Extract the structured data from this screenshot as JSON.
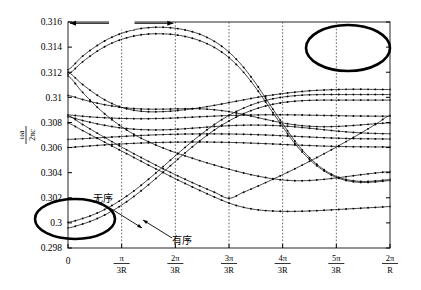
{
  "figure": {
    "bz_label": "1 BZ",
    "annotations": [
      {
        "name": "disordered",
        "text": "无序"
      },
      {
        "name": "ordered",
        "text": "有序"
      }
    ],
    "highlight_ellipses": [
      {
        "name": "top-right-ellipse",
        "cx": 348,
        "cy": 48,
        "rx": 42,
        "ry": 23
      },
      {
        "name": "bottom-left-ellipse",
        "cx": 75,
        "cy": 219,
        "rx": 40,
        "ry": 20
      }
    ]
  },
  "chart_data": {
    "type": "line",
    "title": "",
    "xlabel": "",
    "ylabel": "ωa/2πc",
    "ylabel_parts": {
      "num": "ωa",
      "den": "2πc"
    },
    "xlim": [
      0,
      6
    ],
    "ylim": [
      0.298,
      0.316
    ],
    "grid": "vertical-dotted",
    "legend": "none",
    "marker": "dot",
    "ytick_values": [
      0.298,
      0.3,
      0.302,
      0.304,
      0.306,
      0.308,
      0.31,
      0.312,
      0.314,
      0.316
    ],
    "ytick_labels": [
      "0.298",
      "0.3",
      "0.302",
      "0.304",
      "0.306",
      "0.308",
      "0.31",
      "0.312",
      "0.314",
      "0.316"
    ],
    "xtick_values": [
      0,
      1,
      2,
      3,
      4,
      5,
      6
    ],
    "xtick_labels": [
      "0",
      "π/3R",
      "2π/3R",
      "3π/3R",
      "4π/3R",
      "5π/3R",
      "2π/R"
    ],
    "xtick_parts": [
      {
        "whole": "0"
      },
      {
        "num": "π",
        "den": "3R"
      },
      {
        "num": "2π",
        "den": "3R"
      },
      {
        "num": "3π",
        "den": "3R"
      },
      {
        "num": "4π",
        "den": "3R"
      },
      {
        "num": "5π",
        "den": "3R"
      },
      {
        "num": "2π",
        "den": "R"
      }
    ],
    "x": [
      0,
      0.25,
      0.5,
      0.75,
      1,
      1.25,
      1.5,
      1.75,
      2,
      2.25,
      2.5,
      2.75,
      3,
      3.25,
      3.5,
      3.75,
      4,
      4.25,
      4.5,
      4.75,
      5,
      5.25,
      5.5,
      5.75,
      6
    ],
    "series": [
      {
        "name": "band-1",
        "values": [
          0.3122,
          0.3132,
          0.314,
          0.31465,
          0.3151,
          0.3154,
          0.31555,
          0.31558,
          0.3155,
          0.3153,
          0.31495,
          0.3144,
          0.3136,
          0.3125,
          0.3111,
          0.3095,
          0.3079,
          0.3064,
          0.3052,
          0.3043,
          0.3037,
          0.3034,
          0.3033,
          0.30335,
          0.30345
        ]
      },
      {
        "name": "band-2",
        "values": [
          0.31185,
          0.31275,
          0.31355,
          0.31418,
          0.31462,
          0.3149,
          0.31504,
          0.31506,
          0.31498,
          0.31478,
          0.31444,
          0.31392,
          0.31316,
          0.3121,
          0.31075,
          0.3092,
          0.30765,
          0.3062,
          0.30505,
          0.3042,
          0.30362,
          0.30332,
          0.30322,
          0.30327,
          0.30337
        ]
      },
      {
        "name": "band-3",
        "values": [
          0.312,
          0.3111,
          0.3103,
          0.30965,
          0.3092,
          0.30895,
          0.30885,
          0.30886,
          0.30893,
          0.30905,
          0.3092,
          0.30938,
          0.30958,
          0.30978,
          0.30998,
          0.31015,
          0.3103,
          0.31042,
          0.31052,
          0.31058,
          0.31062,
          0.31064,
          0.31064,
          0.31063,
          0.31062
        ]
      },
      {
        "name": "band-4",
        "values": [
          0.31015,
          0.30985,
          0.30958,
          0.30936,
          0.3092,
          0.3091,
          0.30906,
          0.30906,
          0.30908,
          0.3091,
          0.30908,
          0.309,
          0.30886,
          0.30866,
          0.30842,
          0.30818,
          0.30796,
          0.3078,
          0.3077,
          0.30766,
          0.30768,
          0.30774,
          0.30782,
          0.3079,
          0.30796
        ]
      },
      {
        "name": "band-5",
        "values": [
          0.3086,
          0.3085,
          0.30842,
          0.30836,
          0.30832,
          0.3083,
          0.3083,
          0.30832,
          0.30836,
          0.30841,
          0.30846,
          0.30851,
          0.30855,
          0.30858,
          0.3086,
          0.30861,
          0.30861,
          0.3086,
          0.30858,
          0.30856,
          0.30854,
          0.30852,
          0.30851,
          0.3085,
          0.3085
        ]
      },
      {
        "name": "band-6",
        "values": [
          0.30845,
          0.30818,
          0.30793,
          0.30772,
          0.30756,
          0.30746,
          0.30741,
          0.30741,
          0.30745,
          0.30752,
          0.3076,
          0.30768,
          0.30774,
          0.30778,
          0.30779,
          0.30777,
          0.30772,
          0.30764,
          0.30754,
          0.30743,
          0.30732,
          0.30723,
          0.30716,
          0.30712,
          0.3071
        ]
      },
      {
        "name": "band-7",
        "values": [
          0.30665,
          0.3067,
          0.30676,
          0.30682,
          0.30688,
          0.30694,
          0.30699,
          0.30703,
          0.30706,
          0.30708,
          0.30709,
          0.30709,
          0.30708,
          0.30706,
          0.30703,
          0.30699,
          0.30694,
          0.30689,
          0.30684,
          0.30679,
          0.30675,
          0.30672,
          0.3067,
          0.30669,
          0.30668
        ]
      },
      {
        "name": "band-8",
        "values": [
          0.306,
          0.30608,
          0.30616,
          0.30623,
          0.30629,
          0.30634,
          0.30638,
          0.30641,
          0.30643,
          0.30644,
          0.30644,
          0.30643,
          0.30641,
          0.30638,
          0.30634,
          0.3063,
          0.30625,
          0.3062,
          0.30616,
          0.30612,
          0.30609,
          0.30607,
          0.30606,
          0.30605,
          0.30605
        ]
      },
      {
        "name": "band-9",
        "values": [
          0.30855,
          0.3079,
          0.30726,
          0.30664,
          0.30604,
          0.30546,
          0.3049,
          0.30436,
          0.30384,
          0.30334,
          0.30286,
          0.3024,
          0.30196,
          0.3024,
          0.30286,
          0.30334,
          0.30384,
          0.30436,
          0.3049,
          0.30546,
          0.30604,
          0.30664,
          0.30726,
          0.3079,
          0.30856
        ]
      },
      {
        "name": "band-10",
        "values": [
          0.30795,
          0.3074,
          0.30684,
          0.30628,
          0.30572,
          0.30516,
          0.3046,
          0.30406,
          0.30352,
          0.303,
          0.3025,
          0.30202,
          0.30158,
          0.30126,
          0.30106,
          0.30096,
          0.30092,
          0.30092,
          0.30095,
          0.301,
          0.30106,
          0.30112,
          0.30118,
          0.30124,
          0.3013
        ]
      },
      {
        "name": "band-11",
        "values": [
          0.30005,
          0.30032,
          0.3007,
          0.30122,
          0.30186,
          0.30262,
          0.30348,
          0.3044,
          0.30534,
          0.30626,
          0.30712,
          0.3079,
          0.30856,
          0.3091,
          0.30952,
          0.30982,
          0.31002,
          0.31014,
          0.3102,
          0.31022,
          0.31022,
          0.31022,
          0.31022,
          0.31022,
          0.31022
        ]
      },
      {
        "name": "band-12",
        "values": [
          0.2996,
          0.29988,
          0.30026,
          0.30078,
          0.30142,
          0.30218,
          0.30304,
          0.30396,
          0.3049,
          0.30582,
          0.30668,
          0.30746,
          0.30812,
          0.30866,
          0.30908,
          0.30938,
          0.30958,
          0.3097,
          0.30976,
          0.30978,
          0.30978,
          0.30978,
          0.30978,
          0.30978,
          0.30978
        ]
      },
      {
        "name": "band-13",
        "values": [
          0.3117,
          0.3105,
          0.3094,
          0.30845,
          0.30766,
          0.307,
          0.30646,
          0.306,
          0.3056,
          0.30524,
          0.3049,
          0.30458,
          0.30428,
          0.304,
          0.30376,
          0.30356,
          0.30342,
          0.30336,
          0.30338,
          0.30346,
          0.30358,
          0.30372,
          0.30386,
          0.30398,
          0.30408
        ]
      }
    ]
  }
}
